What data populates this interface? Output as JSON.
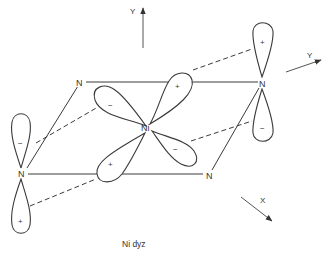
{
  "figure": {
    "caption": "Ni dyz",
    "colors": {
      "ink": "#3a3a3a",
      "background": "#ffffff"
    }
  },
  "atoms": {
    "center": "Ni",
    "n_top_left": "N",
    "n_top_right": "N",
    "n_left": "N",
    "n_bottom_right": "N"
  },
  "axes": {
    "y_vertical": "Y",
    "y_perspective": "Y",
    "x": "X"
  },
  "lobe_signs": {
    "ni_upper_left": "−",
    "ni_upper_right": "+",
    "ni_lower_left": "+",
    "ni_lower_right": "−",
    "n_left_upper": "−",
    "n_left_lower": "+",
    "n_right_upper": "+",
    "n_right_lower": "−"
  }
}
